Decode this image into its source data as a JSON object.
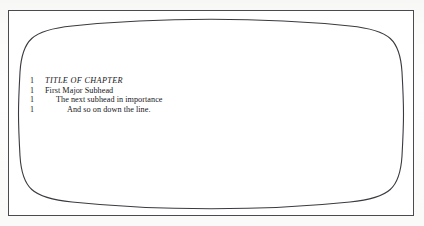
{
  "figure": {
    "kind": "crt-screen-illustration",
    "frame_border_color": "#4a4a50",
    "screen_outline_color": "#3a3a40",
    "screen_fill_color": "#ffffff",
    "page_background_color": "#fdfdfc",
    "text_color": "#17171b"
  },
  "screen": {
    "outline": [
      {
        "number": "1",
        "text": "TITLE OF CHAPTER",
        "level": 0,
        "style": "italic"
      },
      {
        "number": "1",
        "text": "First Major Subhead",
        "level": 1,
        "style": "roman"
      },
      {
        "number": "1",
        "text": "The next subhead in importance",
        "level": 2,
        "style": "roman"
      },
      {
        "number": "1",
        "text": "And so on down the line.",
        "level": 3,
        "style": "roman"
      }
    ]
  }
}
